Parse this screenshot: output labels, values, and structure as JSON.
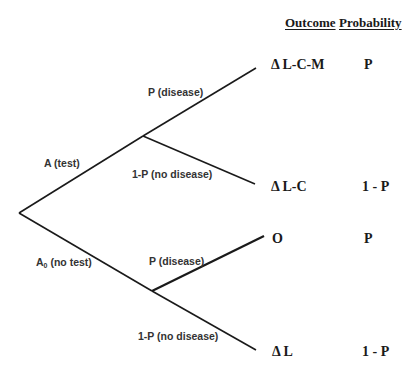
{
  "headers": {
    "outcome": "Outcome",
    "probability": "Probability"
  },
  "decisions": {
    "test": {
      "label": "A (test)"
    },
    "no_test": {
      "label_main": "A",
      "label_sub": "0",
      "label_rest": " (no test)"
    }
  },
  "branches": {
    "test_disease": "P (disease)",
    "test_no_disease": "1-P (no disease)",
    "notest_disease": "P (disease)",
    "notest_no_disease": "1-P (no disease)"
  },
  "outcomes": [
    {
      "outcome": "Δ L-C-M",
      "probability": "P"
    },
    {
      "outcome": "Δ L-C",
      "probability": "1 - P"
    },
    {
      "outcome": "O",
      "probability": "P"
    },
    {
      "outcome": "Δ L",
      "probability": "1 - P"
    }
  ],
  "colors": {
    "line": "#1a1a1a",
    "label": "#333333",
    "background": "#ffffff"
  }
}
